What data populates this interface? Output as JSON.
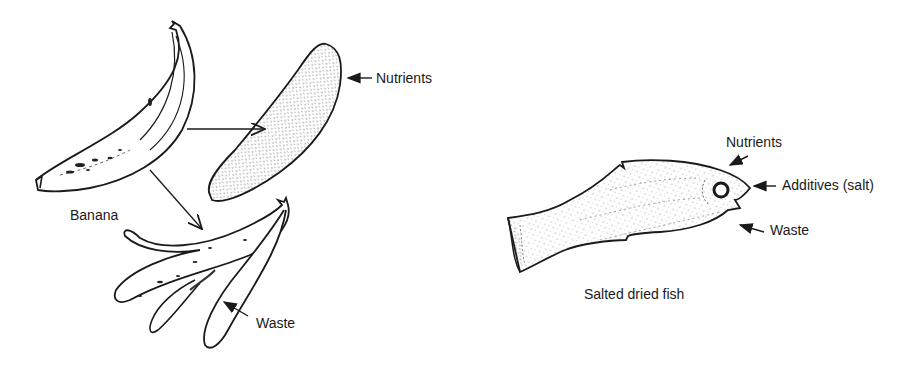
{
  "diagram": {
    "banana_panel": {
      "labels": {
        "whole": "Banana",
        "nutrients": "Nutrients",
        "waste": "Waste"
      }
    },
    "fish_panel": {
      "labels": {
        "whole": "Salted dried fish",
        "nutrients": "Nutrients",
        "additives": "Additives (salt)",
        "waste": "Waste"
      }
    },
    "colors": {
      "ink": "#1a1a1a",
      "paper": "#ffffff"
    }
  }
}
